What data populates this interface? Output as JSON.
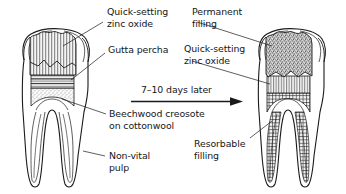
{
  "figure": {
    "transition": {
      "text": "7–10 days later",
      "arrow_icon": "arrow-right-icon"
    },
    "colors": {
      "ink": "#1a1a1a",
      "text": "#15161a",
      "paper": "#ffffff",
      "zinc_oxide_fill": "#efefef",
      "gutta_percha_fill": "#e8e8e8",
      "cottonwool_fill": "#f2f2f2",
      "permanent_filling_fill": "#cfcfcf",
      "resorbable_filling_fill": "#ededed"
    }
  },
  "left_tooth": {
    "name": "Non-vital molar, temporary dressing stage",
    "labels": [
      {
        "id": "quick-setting-zinc-oxide",
        "line1": "Quick-setting",
        "line2": "zinc oxide"
      },
      {
        "id": "gutta-percha",
        "line1": "Gutta percha",
        "line2": ""
      },
      {
        "id": "beechwood-creosote-on-cottonwool",
        "line1": "Beechwood creosote",
        "line2": "on cottonwool"
      },
      {
        "id": "non-vital-pulp",
        "line1": "Non-vital",
        "line2": "pulp"
      }
    ]
  },
  "right_tooth": {
    "name": "Molar after root filling and permanent restoration",
    "labels": [
      {
        "id": "permanent-filling",
        "line1": "Permanent",
        "line2": "filling"
      },
      {
        "id": "quick-setting-zinc-oxide",
        "line1": "Quick-setting",
        "line2": "zinc oxide"
      },
      {
        "id": "resorbable-filling",
        "line1": "Resorbable",
        "line2": "filling"
      }
    ]
  }
}
